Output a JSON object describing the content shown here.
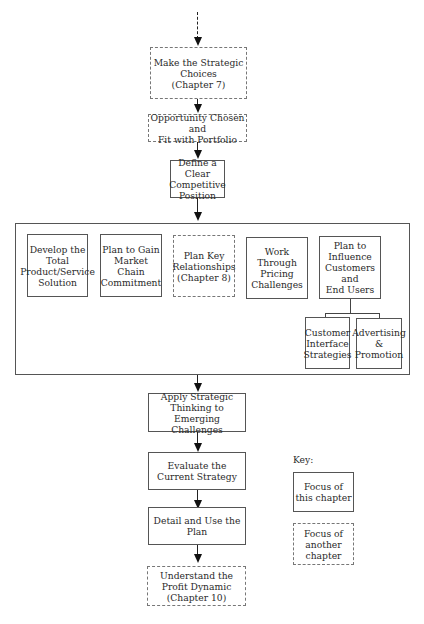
{
  "flow": {
    "make_choices": "Make the Strategic\nChoices\n(Chapter 7)",
    "opportunity": "Opportunity Chosen and\nFit with Portfolio",
    "define_position": "Define a Clear\nCompetitive\nPosition",
    "apply_thinking": "Apply Strategic\nThinking to\nEmerging Challenges",
    "evaluate": "Evaluate the\nCurrent Strategy",
    "detail_plan": "Detail and Use the\nPlan",
    "profit_dynamic": "Understand the\nProfit Dynamic\n(Chapter 10)"
  },
  "group": {
    "develop": "Develop the\nTotal\nProduct/Service\nSolution",
    "market_chain": "Plan to Gain\nMarket Chain\nCommitment",
    "relationships": "Plan Key\nRelationships\n(Chapter 8)",
    "pricing": "Work\nThrough\nPricing\nChallenges",
    "influence": "Plan to\nInfluence\nCustomers and\nEnd Users",
    "customer_interface": "Customer\nInterface\nStrategies",
    "advertising": "Advertising\n&\nPromotion"
  },
  "key": {
    "title": "Key:",
    "this_chapter": "Focus of\nthis chapter",
    "another_chapter": "Focus of\nanother\nchapter"
  }
}
